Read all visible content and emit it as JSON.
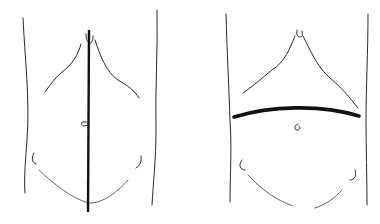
{
  "figure": {
    "panels": [
      {
        "id": "left",
        "description": "Abdomen with vertical midline incision",
        "incision": "vertical-midline",
        "incision_color": "#111111"
      },
      {
        "id": "right",
        "description": "Abdomen with transverse curved incision",
        "incision": "transverse",
        "incision_color": "#111111"
      }
    ],
    "background": "#ffffff",
    "line_color": "#2a2a2a"
  }
}
